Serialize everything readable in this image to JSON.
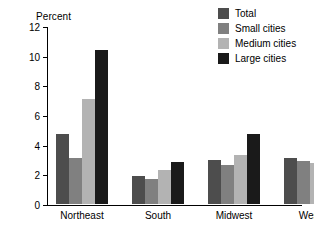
{
  "chart_data": {
    "type": "bar",
    "title": "",
    "xlabel": "",
    "ylabel": "Percent",
    "ylim": [
      0,
      12
    ],
    "yticks": [
      0,
      2,
      4,
      6,
      8,
      10,
      12
    ],
    "grid": false,
    "legend_position": "top-right",
    "categories": [
      "Northeast",
      "South",
      "Midwest",
      "West"
    ],
    "series": [
      {
        "name": "Total",
        "color": "#4d4d4d",
        "values": [
          4.7,
          1.9,
          3.0,
          3.1
        ]
      },
      {
        "name": "Small cities",
        "color": "#808080",
        "values": [
          3.1,
          1.7,
          2.6,
          2.9
        ]
      },
      {
        "name": "Medium cities",
        "color": "#b3b3b3",
        "values": [
          7.1,
          2.3,
          3.3,
          2.75
        ]
      },
      {
        "name": "Large cities",
        "color": "#1a1a1a",
        "values": [
          10.4,
          2.8,
          4.7,
          3.6
        ]
      }
    ]
  }
}
